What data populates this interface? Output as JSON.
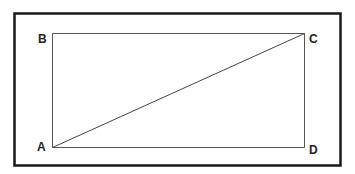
{
  "diagram": {
    "type": "rectangle-with-diagonal",
    "vertices": {
      "A": {
        "label": "A",
        "position": "bottom-left"
      },
      "B": {
        "label": "B",
        "position": "top-left"
      },
      "C": {
        "label": "C",
        "position": "top-right"
      },
      "D": {
        "label": "D",
        "position": "bottom-right"
      }
    },
    "edges": [
      [
        "A",
        "B"
      ],
      [
        "B",
        "C"
      ],
      [
        "C",
        "D"
      ],
      [
        "D",
        "A"
      ],
      [
        "A",
        "C"
      ]
    ],
    "colors": {
      "frame": "#1a1a1a",
      "lines": "#555555",
      "labels": "#222222"
    }
  }
}
